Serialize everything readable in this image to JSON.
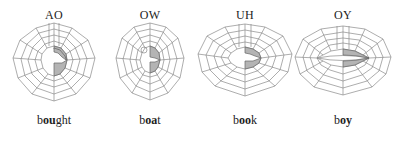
{
  "figure": {
    "panels": [
      {
        "phoneme": "AO",
        "word_prefix": "b",
        "word_vowel": "ou",
        "word_suffix": "ght",
        "mouth": "rounded-open"
      },
      {
        "phoneme": "OW",
        "word_prefix": "b",
        "word_vowel": "oa",
        "word_suffix": "t",
        "mouth": "narrow-rounded"
      },
      {
        "phoneme": "UH",
        "word_prefix": "b",
        "word_vowel": "oo",
        "word_suffix": "k",
        "mouth": "wide-open"
      },
      {
        "phoneme": "OY",
        "word_prefix": "b",
        "word_vowel": "oy",
        "word_suffix": "",
        "mouth": "spread"
      }
    ],
    "colors": {
      "grid": "#8a8a8a",
      "shaded": "#b4b4b4",
      "text": "#222222"
    }
  }
}
